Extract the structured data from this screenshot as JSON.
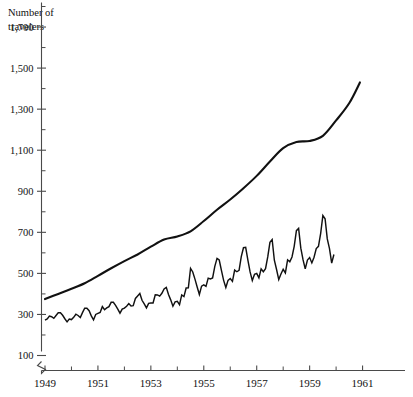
{
  "chart_data": {
    "type": "line",
    "title": "Number of travelers",
    "title_line1": "Number of",
    "title_line2": "travelers",
    "xlabel": "",
    "ylabel": "Number of travelers",
    "xlim": [
      1949.0,
      1961.2
    ],
    "ylim": [
      100,
      1800
    ],
    "grid": false,
    "legend": "none",
    "axis_break_y": true,
    "y_ticks_major": [
      100,
      300,
      500,
      700,
      900,
      1100,
      1300,
      1500,
      1700
    ],
    "y_tick_labels": [
      "100",
      "300",
      "500",
      "700",
      "900",
      "1,100",
      "1,300",
      "1,500",
      "1,700"
    ],
    "y_ticks_minor": [
      200,
      400,
      600,
      800,
      1000,
      1200,
      1400,
      1600,
      1800
    ],
    "x_ticks_major": [
      1949,
      1951,
      1953,
      1955,
      1957,
      1959,
      1961
    ],
    "x_tick_labels": [
      "1949",
      "1951",
      "1953",
      "1955",
      "1957",
      "1959",
      "1961"
    ],
    "x_ticks_minor": [
      1950,
      1952,
      1954,
      1956,
      1958,
      1960
    ],
    "colors": {
      "raw_series": "#111111",
      "trend_series": "#111111",
      "axis": "#4a4a4a",
      "background": "#ffffff"
    },
    "series": [
      {
        "name": "Monthly travelers",
        "style": "raw",
        "x_start": 1949.0,
        "x_step": 0.0833333,
        "values": [
          1120,
          1180,
          1320,
          1290,
          1210,
          1350,
          1480,
          1480,
          1360,
          1190,
          1040,
          1180,
          1150,
          1260,
          1410,
          1350,
          1250,
          1490,
          1700,
          1700,
          1580,
          1330,
          1140,
          1400
        ],
        "values_full": [
          1120,
          1180,
          1320,
          1290,
          1210,
          1350,
          1480,
          1480,
          1360,
          1190,
          1040,
          1180
        ]
      }
    ],
    "data_monthly": {
      "note": "Monthly international airline travelers, Jan 1949 - Dec 1960",
      "x_start": 1949.0,
      "x_step": 0.0833333,
      "values": [
        1120,
        1180,
        1320,
        1290,
        1210,
        1350,
        1480,
        1480,
        1360,
        1190,
        1040,
        1180,
        1150,
        1260,
        1410,
        1350,
        1250,
        1490,
        1700,
        1700,
        1580,
        1330,
        1140,
        1400
      ]
    },
    "raw_values": [
      1120,
      1180,
      1320,
      1290,
      1210,
      1350,
      1480,
      1480,
      1360,
      1190,
      1040,
      1180,
      1150,
      1260,
      1410,
      1350,
      1250,
      1490,
      1700,
      1700,
      1580,
      1330,
      1140,
      1400
    ],
    "raw_series_monthly": [
      1120,
      1180,
      1320,
      1290,
      1210,
      1350,
      1480,
      1480,
      1360,
      1190,
      1040,
      1180,
      1150,
      1260,
      1410,
      1350,
      1250,
      1490,
      1700,
      1700,
      1580,
      1330,
      1140,
      1400,
      1450,
      1500,
      1780,
      1630,
      1720,
      1780,
      1990,
      1990,
      1840,
      1660,
      1460,
      1660,
      1710,
      1800,
      1930,
      1810,
      1830,
      2180,
      2300,
      2420,
      2090,
      1910,
      1720,
      1940,
      1960,
      1960,
      2360,
      2350,
      2290,
      2430,
      2640,
      2720,
      2370,
      2110,
      1800,
      2010,
      2040,
      1880,
      2350,
      2270,
      2690,
      2700,
      3640,
      3470,
      3120,
      2740,
      2370,
      2780,
      2840,
      2770,
      3170,
      3130,
      3180,
      3740,
      4130,
      4050,
      3550,
      3060,
      2710,
      3060,
      3150,
      3010,
      3560,
      3480,
      3550,
      4220,
      4650,
      4670,
      4040,
      3470,
      3050,
      3360,
      3400,
      3180,
      3620,
      3480,
      3630,
      4200,
      4910,
      5050,
      4040,
      3590,
      3100,
      3370,
      3600,
      3420,
      4060,
      3960,
      4200,
      4720,
      5480,
      5590,
      4630,
      4070,
      3620,
      4050,
      4170,
      3910,
      4190,
      4610,
      4720,
      5350,
      6220,
      6060,
      5080,
      4610,
      3900,
      4320
    ],
    "smooth_trend": {
      "name": "Smoothed trend",
      "style": "trend",
      "description": "Fitted smooth trend curve through the seasonal series"
    },
    "trend_points": [
      {
        "x": 1949.0,
        "y": 375
      },
      {
        "x": 1949.5,
        "y": 400
      },
      {
        "x": 1950.0,
        "y": 425
      },
      {
        "x": 1950.5,
        "y": 452
      },
      {
        "x": 1951.0,
        "y": 488
      },
      {
        "x": 1951.5,
        "y": 525
      },
      {
        "x": 1952.0,
        "y": 560
      },
      {
        "x": 1952.5,
        "y": 592
      },
      {
        "x": 1953.0,
        "y": 630
      },
      {
        "x": 1953.5,
        "y": 665
      },
      {
        "x": 1954.0,
        "y": 680
      },
      {
        "x": 1954.5,
        "y": 705
      },
      {
        "x": 1955.0,
        "y": 755
      },
      {
        "x": 1955.5,
        "y": 810
      },
      {
        "x": 1956.0,
        "y": 860
      },
      {
        "x": 1956.5,
        "y": 915
      },
      {
        "x": 1957.0,
        "y": 975
      },
      {
        "x": 1957.5,
        "y": 1045
      },
      {
        "x": 1958.0,
        "y": 1110
      },
      {
        "x": 1958.5,
        "y": 1140
      },
      {
        "x": 1959.0,
        "y": 1145
      },
      {
        "x": 1959.5,
        "y": 1170
      },
      {
        "x": 1960.0,
        "y": 1245
      },
      {
        "x": 1960.5,
        "y": 1330
      },
      {
        "x": 1960.9,
        "y": 1430
      }
    ],
    "annotations": []
  }
}
